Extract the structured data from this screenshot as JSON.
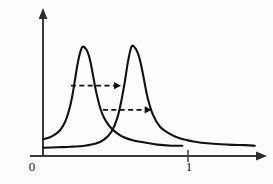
{
  "figure": {
    "title": "",
    "background_color": "#fdfdfd",
    "curve_color": "#111111",
    "axis_color": "#3a3a3a",
    "annotation_color": "#111111"
  },
  "axes": {
    "x_axis_name": "x-axis",
    "y_axis_name": "y-axis",
    "x_tick_labels": [
      "0",
      "1"
    ],
    "x_tick_values": [
      0,
      1
    ],
    "y_tick_labels": [],
    "x_arrow": "arrow-right",
    "y_arrow": "arrow-up",
    "grid": "off"
  },
  "annotations": [
    {
      "name": "shift-arrow-upper",
      "type": "dashed-arrow-right",
      "label": "",
      "x_start": 0.2,
      "x_end": 0.56,
      "y": 0.63
    },
    {
      "name": "shift-arrow-lower",
      "type": "dashed-arrow-right",
      "label": "",
      "x_start": 0.43,
      "x_end": 0.78,
      "y": 0.4
    }
  ],
  "chart_data": {
    "type": "line",
    "title": "",
    "subtitle": "",
    "xlabel": "",
    "ylabel": "",
    "xlim": [
      0,
      1.55
    ],
    "ylim": [
      0,
      1.12
    ],
    "grid": false,
    "legend": "none",
    "tick_labels_x": [
      "0",
      "1"
    ],
    "tick_values_x": [
      0,
      1
    ],
    "series": [
      {
        "name": "resonance-peak-1",
        "peak_x": 0.285,
        "peak_y": 1.0,
        "baseline_y": 0.0,
        "x": [
          0.0,
          0.05,
          0.1,
          0.13,
          0.16,
          0.19,
          0.21,
          0.23,
          0.25,
          0.27,
          0.285,
          0.3,
          0.32,
          0.34,
          0.36,
          0.38,
          0.41,
          0.44,
          0.48,
          0.53,
          0.58,
          0.65,
          0.73,
          0.82,
          0.92,
          1.0
        ],
        "y": [
          0.12,
          0.14,
          0.18,
          0.22,
          0.29,
          0.41,
          0.53,
          0.69,
          0.85,
          0.96,
          1.0,
          0.99,
          0.95,
          0.86,
          0.72,
          0.58,
          0.42,
          0.32,
          0.24,
          0.18,
          0.14,
          0.11,
          0.09,
          0.07,
          0.06,
          0.06
        ]
      },
      {
        "name": "resonance-peak-2",
        "peak_x": 0.635,
        "peak_y": 1.0,
        "baseline_y": 0.0,
        "x": [
          0.0,
          0.1,
          0.2,
          0.3,
          0.38,
          0.44,
          0.49,
          0.53,
          0.56,
          0.59,
          0.61,
          0.635,
          0.66,
          0.68,
          0.7,
          0.72,
          0.75,
          0.79,
          0.84,
          0.9,
          0.98,
          1.08,
          1.2,
          1.33,
          1.45,
          1.52
        ],
        "y": [
          0.04,
          0.045,
          0.05,
          0.06,
          0.08,
          0.12,
          0.19,
          0.31,
          0.47,
          0.69,
          0.86,
          1.0,
          0.99,
          0.94,
          0.85,
          0.72,
          0.52,
          0.35,
          0.24,
          0.18,
          0.13,
          0.1,
          0.08,
          0.07,
          0.065,
          0.06
        ]
      }
    ],
    "annotation_arrows": [
      {
        "name": "shift-arrow-upper",
        "from_x": 0.2,
        "to_x": 0.56,
        "at_y": 0.63,
        "style": "dashed"
      },
      {
        "name": "shift-arrow-lower",
        "from_x": 0.43,
        "to_x": 0.78,
        "at_y": 0.4,
        "style": "dashed"
      }
    ]
  }
}
